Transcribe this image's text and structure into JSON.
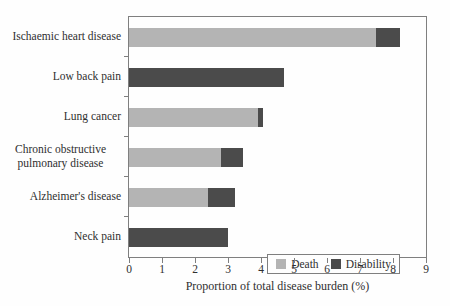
{
  "chart_data": {
    "type": "bar",
    "orientation": "horizontal",
    "stacked": true,
    "title": "",
    "xlabel": "Proportion of total disease burden (%)",
    "ylabel": "",
    "xlim": [
      0,
      9
    ],
    "xticks": [
      0,
      1,
      2,
      3,
      4,
      5,
      6,
      7,
      8,
      9
    ],
    "grid": false,
    "legend_position": "lower right",
    "categories": [
      "Ischaemic heart disease",
      "Low back pain",
      "Lung cancer",
      "Chronic obstructive pulmonary disease",
      "Alzheimer's disease",
      "Neck pain"
    ],
    "series": [
      {
        "name": "Death",
        "color": "#b4b4b4",
        "values": [
          7.5,
          0,
          3.9,
          2.8,
          2.4,
          0
        ]
      },
      {
        "name": "Disability",
        "color": "#4b4b4b",
        "values": [
          0.7,
          4.7,
          0.15,
          0.65,
          0.8,
          3.0
        ]
      }
    ],
    "totals": [
      8.2,
      4.7,
      4.05,
      3.45,
      3.2,
      3.0
    ]
  },
  "colors": {
    "frame": "#7f7f7f",
    "text": "#2f2f2f",
    "background": "#fefefe"
  }
}
